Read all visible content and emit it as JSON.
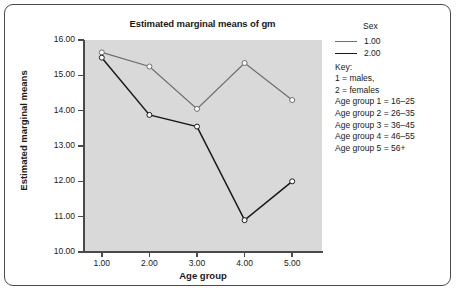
{
  "chart_data": {
    "type": "line",
    "title": "Estimated marginal means of gm",
    "xlabel": "Age group",
    "ylabel": "Estimated marginal means",
    "categories": [
      "1.00",
      "2.00",
      "3.00",
      "4.00",
      "5.00"
    ],
    "ylim": [
      10.0,
      16.0
    ],
    "yticks": [
      "10.00",
      "11.00",
      "12.00",
      "13.00",
      "14.00",
      "15.00",
      "16.00"
    ],
    "ytick_values": [
      10,
      11,
      12,
      13,
      14,
      15,
      16
    ],
    "grid": false,
    "legend_position": "right",
    "plot_background": "#d9d9d9",
    "marker": "open-circle",
    "series": [
      {
        "name": "1.00",
        "color": "#6e6e6e",
        "values": [
          15.65,
          15.25,
          14.05,
          15.35,
          14.3
        ]
      },
      {
        "name": "2.00",
        "color": "#1a1a1a",
        "values": [
          15.5,
          13.88,
          13.55,
          10.9,
          12.0
        ]
      }
    ]
  },
  "legend": {
    "title": "Sex",
    "entries": [
      {
        "label": "1.00",
        "color": "#6e6e6e"
      },
      {
        "label": "2.00",
        "color": "#1a1a1a"
      }
    ],
    "key_heading": "Key:",
    "key_lines": [
      "1 = males,",
      "2 = females",
      "Age group 1 = 16–25",
      "Age group 2 = 26–35",
      "Age group 3 = 36–45",
      "Age group 4 = 46–55",
      "Age group 5 = 56+"
    ]
  }
}
